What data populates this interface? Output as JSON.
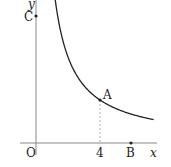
{
  "figure": {
    "axes": {
      "x_label": "x",
      "y_label": "y",
      "origin_label": "O"
    },
    "ticks": {
      "x_tick_label": "4"
    },
    "points": {
      "A": {
        "label": "A",
        "x": 4
      },
      "B": {
        "label": "B",
        "x": 6
      },
      "C": {
        "label": "C",
        "y": 8
      }
    },
    "curve": {
      "description": "hyperbola-like decreasing curve in first quadrant passing through A"
    },
    "colors": {
      "axis": "#888888",
      "curve": "#222222",
      "guide": "#999999"
    }
  }
}
